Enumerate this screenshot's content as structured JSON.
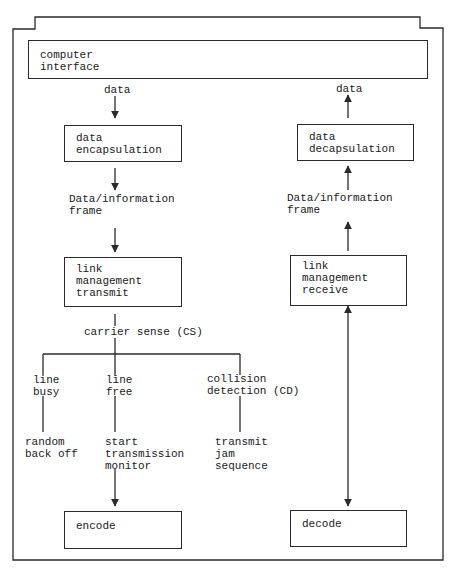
{
  "diagram": {
    "title": "",
    "top": {
      "computer_interface": "computer\ninterface"
    },
    "transmit_path": {
      "data_label": "data",
      "encapsulation_box": "data\nencapsulation",
      "frame_label": "Data/information\nframe",
      "link_management_box": "link\nmanagement\ntransmit",
      "carrier_sense_label": "carrier sense (CS)",
      "branches": [
        {
          "condition": "line\nbusy",
          "action": "random\nback off"
        },
        {
          "condition": "line\nfree",
          "action": "start\ntransmission\nmonitor"
        },
        {
          "condition": "collision\ndetection (CD)",
          "action": "transmit\njam\nsequence"
        }
      ],
      "encode_box": "encode"
    },
    "receive_path": {
      "data_label": "data",
      "decapsulation_box": "data\ndecapsulation",
      "frame_label": "Data/information\nframe",
      "link_management_box": "link\nmanagement\nreceive",
      "decode_box": "decode"
    },
    "colors": {
      "line": "#2a2a2a",
      "text": "#1a1a1a",
      "background": "#ffffff"
    }
  }
}
